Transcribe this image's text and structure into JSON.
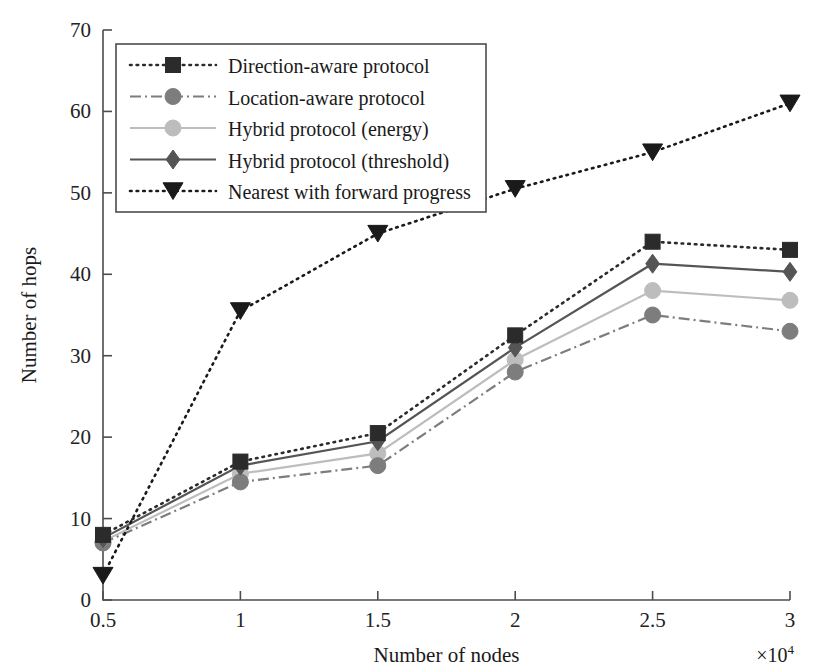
{
  "chart_data": {
    "type": "line",
    "title": "",
    "xlabel": "Number of nodes",
    "ylabel": "Number of hops",
    "x_multiplier": "×10",
    "x_multiplier_exp": "4",
    "x": [
      0.5,
      1,
      1.5,
      2,
      2.5,
      3
    ],
    "xticklabels": [
      "0.5",
      "1",
      "1.5",
      "2",
      "2.5",
      "3"
    ],
    "yticks": [
      0,
      10,
      20,
      30,
      40,
      50,
      60,
      70
    ],
    "yticklabels": [
      "0",
      "10",
      "20",
      "30",
      "40",
      "50",
      "60",
      "70"
    ],
    "xlim": [
      0.5,
      3
    ],
    "ylim": [
      0,
      70
    ],
    "grid": false,
    "legend_position": "upper-left-inside",
    "series": [
      {
        "name": "Direction-aware protocol",
        "values": [
          8,
          17,
          20.5,
          32.5,
          44,
          43
        ],
        "color": "#2b2b2b",
        "linestyle": "dotted",
        "marker": "square"
      },
      {
        "name": "Location-aware protocol",
        "values": [
          7,
          14.5,
          16.5,
          28,
          35,
          33
        ],
        "color": "#7d7d7d",
        "linestyle": "dashdot",
        "marker": "circle"
      },
      {
        "name": "Hybrid protocol (energy)",
        "values": [
          7.2,
          15.5,
          18,
          29.5,
          38,
          36.8
        ],
        "color": "#bdbdbd",
        "linestyle": "solid",
        "marker": "circle"
      },
      {
        "name": "Hybrid protocol (threshold)",
        "values": [
          7.6,
          16.5,
          19.5,
          31,
          41.3,
          40.3
        ],
        "color": "#555555",
        "linestyle": "solid",
        "marker": "diamond"
      },
      {
        "name": "Nearest with forward progress",
        "values": [
          3,
          35.5,
          45,
          50.5,
          55,
          61
        ],
        "color": "#1a1a1a",
        "linestyle": "dotted",
        "marker": "triangle-down"
      }
    ]
  },
  "legend": {
    "items": [
      "Direction-aware protocol",
      "Location-aware protocol",
      "Hybrid protocol (energy)",
      "Hybrid protocol (threshold)",
      "Nearest with forward progress"
    ]
  },
  "axes": {
    "y_title": "Number of hops",
    "x_title": "Number of nodes"
  }
}
